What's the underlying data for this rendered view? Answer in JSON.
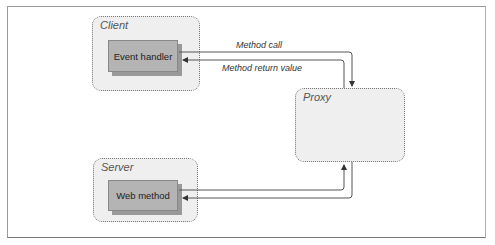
{
  "diagram": {
    "groups": {
      "client": {
        "label": "Client"
      },
      "proxy": {
        "label": "Proxy"
      },
      "server": {
        "label": "Server"
      }
    },
    "components": {
      "event_handler": {
        "label": "Event handler"
      },
      "web_method": {
        "label": "Web method"
      }
    },
    "edges": {
      "method_call": {
        "label": "Method call",
        "from": "Event handler",
        "to": "Proxy"
      },
      "method_return": {
        "label": "Method return value",
        "from": "Proxy",
        "to": "Event handler"
      },
      "proxy_to_server": {
        "label": "",
        "from": "Proxy",
        "to": "Web method"
      },
      "server_to_proxy": {
        "label": "",
        "from": "Web method",
        "to": "Proxy"
      }
    },
    "colors": {
      "group_fill": "#efefef",
      "component_fill": "#b4b4b4",
      "line": "#555555"
    }
  }
}
